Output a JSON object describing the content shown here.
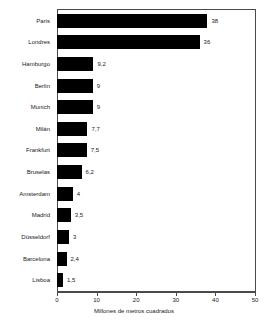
{
  "chart_data": {
    "type": "bar",
    "orientation": "horizontal",
    "title": "",
    "xlabel": "Millones de metros cuadrados",
    "ylabel": "",
    "xlim": [
      0,
      50
    ],
    "grid": false,
    "legend": null,
    "categories": [
      "Paris",
      "Londres",
      "Hamburgo",
      "Berlin",
      "Munich",
      "Milán",
      "Frankfurt",
      "Bruselas",
      "Amsterdam",
      "Madrid",
      "Düsseldorf",
      "Barcelona",
      "Lisboa"
    ],
    "values": [
      38,
      36,
      9.2,
      9,
      9,
      7.7,
      7.5,
      6.2,
      4,
      3.5,
      3,
      2.4,
      1.5
    ],
    "value_labels": [
      "38",
      "36",
      "9,2",
      "9",
      "9",
      "7,7",
      "7,5",
      "6,2",
      "4",
      "3,5",
      "3",
      "2,4",
      "1,5"
    ],
    "x_ticks": [
      0,
      10,
      20,
      30,
      40,
      50
    ],
    "x_tick_labels": [
      "0",
      "10",
      "20",
      "30",
      "40",
      "50"
    ],
    "bar_color": "#000000",
    "frame_color": "#4a4a4a",
    "background_color": "#ffffff"
  }
}
